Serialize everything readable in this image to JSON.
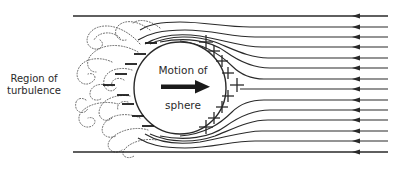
{
  "diagram": {
    "labels": {
      "region_line1": "Region of",
      "region_line2": "turbulence",
      "motion_line1": "Motion of",
      "motion_line2": "sphere"
    },
    "sphere": {
      "cx": 180,
      "cy": 88,
      "r": 46
    },
    "streamlines": {
      "count": 14,
      "y_top": 16,
      "y_bottom": 152,
      "x_end": 388,
      "arrow_x": 357,
      "direction": "right-to-left"
    },
    "charges": {
      "positive_symbol": "+",
      "negative_symbol": "−",
      "positive_side": "front (right)",
      "negative_side": "rear (left)"
    },
    "colors": {
      "line": "#2a2a2a",
      "dotted": "#555555",
      "background": "#ffffff"
    }
  }
}
